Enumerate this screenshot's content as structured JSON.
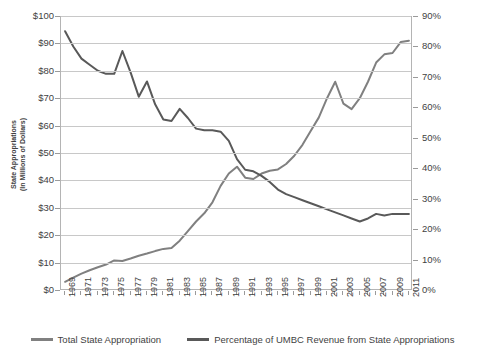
{
  "chart_data": {
    "type": "line",
    "title": "",
    "xlabel": "",
    "ylabel": "State  Appropriations\n(In Millions of Dollars)",
    "y2label": "",
    "grid": true,
    "legend_position": "bottom",
    "ylim": [
      0,
      100
    ],
    "y2lim": [
      0,
      90
    ],
    "xlim": [
      1969,
      2011
    ],
    "y_ticks": [
      "$0",
      "$10",
      "$20",
      "$30",
      "$40",
      "$50",
      "$60",
      "$70",
      "$80",
      "$90",
      "$100"
    ],
    "y_tick_values": [
      0,
      10,
      20,
      30,
      40,
      50,
      60,
      70,
      80,
      90,
      100
    ],
    "y2_ticks": [
      "0%",
      "10%",
      "20%",
      "30%",
      "40%",
      "50%",
      "60%",
      "70%",
      "80%",
      "90%"
    ],
    "y2_tick_values": [
      0,
      10,
      20,
      30,
      40,
      50,
      60,
      70,
      80,
      90
    ],
    "x": [
      1969,
      1970,
      1971,
      1972,
      1973,
      1974,
      1975,
      1976,
      1977,
      1978,
      1979,
      1980,
      1981,
      1982,
      1983,
      1984,
      1985,
      1986,
      1987,
      1988,
      1989,
      1990,
      1991,
      1992,
      1993,
      1994,
      1995,
      1996,
      1997,
      1998,
      1999,
      2000,
      2001,
      2002,
      2003,
      2004,
      2005,
      2006,
      2007,
      2008,
      2009,
      2010,
      2011
    ],
    "x_tick_labels": [
      "1969",
      "1971",
      "1973",
      "1975",
      "1977",
      "1979",
      "1981",
      "1983",
      "1985",
      "1987",
      "1989",
      "1991",
      "1993",
      "1995",
      "1997",
      "1999",
      "2001",
      "2003",
      "2005",
      "2007",
      "2009",
      "2011"
    ],
    "series": [
      {
        "name": "Total State Appropriation",
        "axis": "left",
        "unit": "millions of dollars",
        "color": "#808080",
        "values": [
          3.0,
          4.5,
          6.0,
          7.2,
          8.3,
          9.3,
          10.8,
          10.6,
          11.5,
          12.5,
          13.3,
          14.2,
          15.0,
          15.3,
          18.0,
          21.5,
          25.0,
          28.0,
          32.0,
          38.0,
          42.5,
          45.0,
          41.0,
          40.5,
          42.5,
          43.5,
          44.0,
          46.0,
          49.0,
          53.0,
          58.0,
          63.0,
          70.0,
          76.0,
          68.0,
          66.0,
          70.0,
          76.0,
          83.0,
          86.0,
          86.5,
          90.5,
          91.0
        ]
      },
      {
        "name": "Percentage of UMBC Revenue from State Appropriations",
        "axis": "right",
        "unit": "percent",
        "color": "#595959",
        "values": [
          85.0,
          80.0,
          76.0,
          74.0,
          72.0,
          71.0,
          71.0,
          78.5,
          71.5,
          63.5,
          68.5,
          61.0,
          56.0,
          55.5,
          59.5,
          56.5,
          53.0,
          52.5,
          52.5,
          52.0,
          49.0,
          43.0,
          39.5,
          39.0,
          37.5,
          35.5,
          33.0,
          31.5,
          30.5,
          29.5,
          28.5,
          27.5,
          26.5,
          25.5,
          24.5,
          23.5,
          22.5,
          23.5,
          25.0,
          24.5,
          25.0,
          25.0,
          25.0
        ]
      }
    ]
  },
  "axes": {
    "y_left_title": "State  Appropriations (In Millions of Dollars)",
    "y_left_title_line1": "State  Appropriations",
    "y_left_title_line2": "(In Millions of Dollars)"
  },
  "legend": {
    "items": [
      {
        "label": "Total State Appropriation",
        "color": "#808080"
      },
      {
        "label": "Percentage of UMBC Revenue from State Appropriations",
        "color": "#595959"
      }
    ]
  },
  "colors": {
    "gridline": "#c8c8c8",
    "axis": "#b4b4b4",
    "text": "#3f3f3f",
    "background": "#ffffff",
    "series_appropriation": "#808080",
    "series_percentage": "#595959"
  }
}
